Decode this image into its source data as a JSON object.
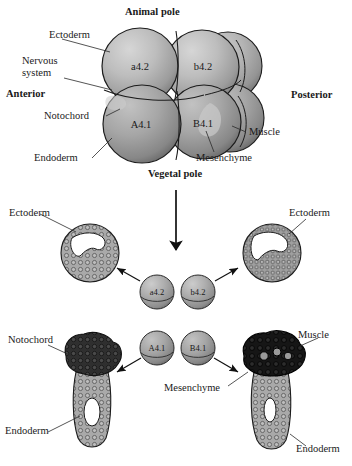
{
  "figure": {
    "type": "embryo-fate-map-diagram",
    "organism_stage": "8-cell embryo",
    "top_panel": {
      "axis_labels": {
        "animal_pole": "Animal pole",
        "vegetal_pole": "Vegetal pole",
        "anterior": "Anterior",
        "posterior": "Posterior"
      },
      "blastomeres": [
        {
          "name": "a4.2",
          "position": "animal-anterior"
        },
        {
          "name": "b4.2",
          "position": "animal-posterior"
        },
        {
          "name": "A4.1",
          "position": "vegetal-anterior"
        },
        {
          "name": "B4.1",
          "position": "vegetal-posterior"
        }
      ],
      "tissue_labels": [
        {
          "text": "Ectoderm",
          "side": "left"
        },
        {
          "text": "Nervous system",
          "side": "left",
          "line1": "Nervous",
          "line2": "system"
        },
        {
          "text": "Notochord",
          "side": "left"
        },
        {
          "text": "Endoderm",
          "side": "left"
        },
        {
          "text": "Muscle",
          "side": "right"
        },
        {
          "text": "Mesenchyme",
          "side": "right"
        }
      ]
    },
    "bottom_panel": {
      "isolated_blastomeres": [
        {
          "name": "a4.2"
        },
        {
          "name": "b4.2"
        },
        {
          "name": "A4.1"
        },
        {
          "name": "B4.1"
        }
      ],
      "derivatives": [
        {
          "id": "upper-left",
          "labels": [
            "Ectoderm"
          ],
          "from": "a4.2"
        },
        {
          "id": "upper-right",
          "labels": [
            "Ectoderm"
          ],
          "from": "b4.2"
        },
        {
          "id": "lower-left",
          "labels": [
            "Notochord",
            "Endoderm"
          ],
          "from": "A4.1"
        },
        {
          "id": "lower-right",
          "labels": [
            "Muscle",
            "Mesenchyme",
            "Endoderm"
          ],
          "from": "B4.1"
        }
      ],
      "label_ectoderm_left": "Ectoderm",
      "label_ectoderm_right": "Ectoderm",
      "label_notochord": "Notochord",
      "label_endoderm_left": "Endoderm",
      "label_muscle": "Muscle",
      "label_mesenchyme": "Mesenchyme",
      "label_endoderm_right": "Endoderm"
    },
    "colors": {
      "cell_light": "#b9b9b9",
      "cell_mid": "#9a9a9a",
      "cell_dark": "#6e6e6e",
      "tissue_light": "#a8a8a8",
      "tissue_dark": "#2a2a2a",
      "outline": "#1c1c1c",
      "text": "#1a1a1a",
      "background": "#ffffff"
    }
  }
}
